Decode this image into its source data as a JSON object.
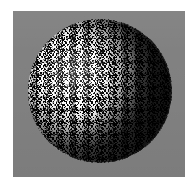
{
  "figure": {
    "name": "textured-sphere-render",
    "canvas": {
      "width": 196,
      "height": 182,
      "page_background": "#ffffff"
    },
    "plate": {
      "name": "image-plate",
      "x": 13,
      "y": 11,
      "width": 172,
      "height": 166,
      "background_color": "#808080"
    },
    "sphere": {
      "name": "noise-textured-sphere",
      "center_x": 100,
      "center_y": 91,
      "radius": 72,
      "texture": "speckled-binary-noise",
      "texture_colors": [
        "#000000",
        "#ffffff"
      ],
      "body_mid_tone": "#808080",
      "highlight_color": "#e8e8e8",
      "shadow_color": "#1a1a1a",
      "light_direction": "upper-left",
      "highlight_position": "33% 37%",
      "limb_darkening": true,
      "terminator_side": "right"
    },
    "labels": {
      "title": "",
      "caption": "",
      "axis_x": "",
      "axis_y": ""
    }
  }
}
